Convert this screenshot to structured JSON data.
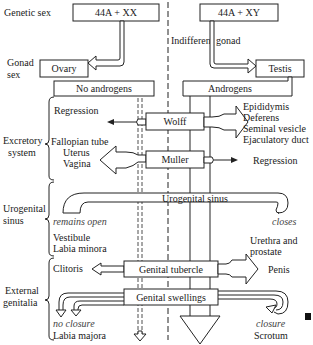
{
  "diagram": {
    "type": "sexual-differentiation-flowchart",
    "row_labels": {
      "genetic_sex": "Genetic sex",
      "gonad_sex_1": "Gonad",
      "gonad_sex_2": "sex",
      "excretory_1": "Excretory",
      "excretory_2": "system",
      "urogenital_1": "Urogenital",
      "urogenital_2": "sinus",
      "external_1": "External",
      "external_2": "genitalia"
    },
    "boxes": {
      "female_karyotype": "44A + XX",
      "male_karyotype": "44A + XY",
      "ovary": "Ovary",
      "testis": "Testis",
      "no_androgens": "No androgens",
      "androgens": "Androgens",
      "wolff": "Wolff",
      "muller": "Muller",
      "urogenital_sinus": "Urogenital sinus",
      "genital_tubercle": "Genital tubercle",
      "genital_swellings": "Genital swellings"
    },
    "labels": {
      "indifferent_gonad": "Indifferent gonad",
      "female_wolff_fate": "Regression",
      "male_wolff_fate": [
        "Epididymis",
        "Deferens",
        "Seminal vesicle",
        "Ejaculatory duct"
      ],
      "female_muller_fate": [
        "Fallopian tube",
        "Uterus",
        "Vagina"
      ],
      "male_muller_fate": "Regression",
      "remains_open": "remains open",
      "closes": "closes",
      "female_sinus_fate": [
        "Vestibule",
        "Labia minora"
      ],
      "male_sinus_fate": [
        "Urethra and",
        "prostate"
      ],
      "female_tubercle_fate": "Clitoris",
      "male_tubercle_fate": "Penis",
      "no_closure": "no closure",
      "female_swellings_fate": "Labia majora",
      "closure": "closure",
      "male_swellings_fate": "Scrotum"
    }
  }
}
